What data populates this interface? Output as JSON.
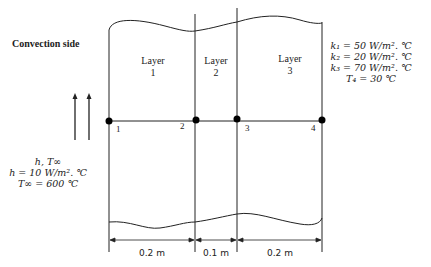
{
  "labels": {
    "convection_side": "Convection side",
    "layers": [
      {
        "line1": "Layer",
        "line2": "1"
      },
      {
        "line1": "Layer",
        "line2": "2"
      },
      {
        "line1": "Layer",
        "line2": "3"
      }
    ],
    "nodes": [
      "1",
      "2",
      "3",
      "4"
    ]
  },
  "properties": {
    "k1": "k₁ = 50 W/m². ℃",
    "k2": "k₂ = 20 W/m². ℃",
    "k3": "k₃ = 70 W/m². ℃",
    "T4": "T₄ = 30 ℃"
  },
  "convection": {
    "symbol": "h, T∞",
    "h": "h = 10 W/m². ℃",
    "T_inf": "T∞ = 600 ℃"
  },
  "dimensions": [
    "0.2 m",
    "0.1 m",
    "0.2 m"
  ],
  "colors": {
    "line": "#222222",
    "node": "#000000"
  }
}
